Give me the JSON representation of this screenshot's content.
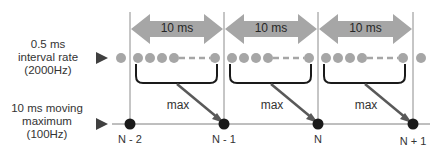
{
  "diagram": {
    "left_labels": {
      "top": [
        "0.5 ms",
        "interval rate",
        "(2000Hz)"
      ],
      "bottom": [
        "10 ms moving",
        "maximum",
        "(100Hz)"
      ]
    },
    "windows": [
      {
        "label": "10 ms",
        "max_label": "max"
      },
      {
        "label": "10 ms",
        "max_label": "max"
      },
      {
        "label": "10 ms",
        "max_label": "max"
      }
    ],
    "points": [
      "N - 2",
      "N - 1",
      "N",
      "N + 1"
    ],
    "colors": {
      "arrow": "#a6a6a6",
      "sample_dot": "#a6a6a6",
      "output_dot": "#1a1a1a",
      "line": "#7f7f7f",
      "bracket": "#1a1a1a",
      "pointer": "#595959"
    }
  }
}
